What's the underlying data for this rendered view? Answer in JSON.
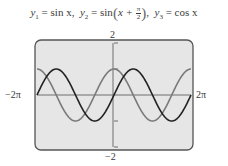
{
  "title": {
    "y1_label": "y",
    "y1_sub": "1",
    "y1_expr": "sin x,",
    "y2_label": "y",
    "y2_sub": "2",
    "y2_expr_prefix": "sin",
    "y2_expr_inner": "x +",
    "y2_frac_num": "π",
    "y2_frac_den": "2",
    "y2_suffix": ",",
    "y3_label": "y",
    "y3_sub": "3",
    "y3_expr": "cos x",
    "equals": "="
  },
  "axes": {
    "xmin_label": "−2π",
    "xmax_label": "2π",
    "ymax_label": "2",
    "ymin_label": "−2"
  },
  "colors": {
    "screen_bg": "#e6e6e6",
    "frame": "#555555",
    "axis": "#6e6e6e",
    "sin_curve": "#222222",
    "cos_curve": "#7a7a7a"
  },
  "chart_data": {
    "type": "line",
    "xlabel": "",
    "ylabel": "",
    "xlim": [
      -6.2832,
      6.2832
    ],
    "ylim": [
      -2,
      2
    ],
    "x_tick_labels": [
      "−2π",
      "2π"
    ],
    "y_tick_labels": [
      "2",
      "−2"
    ],
    "y_ticks": [
      -1,
      1
    ],
    "grid": false,
    "legend": "none",
    "series": [
      {
        "name": "y1 = sin x",
        "function": "sin(x)",
        "color": "#222222",
        "x": [
          -6.2832,
          -4.7124,
          -3.1416,
          -1.5708,
          0,
          1.5708,
          3.1416,
          4.7124,
          6.2832
        ],
        "values": [
          0,
          1,
          0,
          -1,
          0,
          1,
          0,
          -1,
          0
        ]
      },
      {
        "name": "y2 = sin(x + π/2)",
        "function": "sin(x + pi/2)",
        "color": "#7a7a7a",
        "x": [
          -6.2832,
          -4.7124,
          -3.1416,
          -1.5708,
          0,
          1.5708,
          3.1416,
          4.7124,
          6.2832
        ],
        "values": [
          1,
          0,
          -1,
          0,
          1,
          0,
          -1,
          0,
          1
        ]
      },
      {
        "name": "y3 = cos x",
        "function": "cos(x)",
        "color": "#7a7a7a",
        "x": [
          -6.2832,
          -4.7124,
          -3.1416,
          -1.5708,
          0,
          1.5708,
          3.1416,
          4.7124,
          6.2832
        ],
        "values": [
          1,
          0,
          -1,
          0,
          1,
          0,
          -1,
          0,
          1
        ]
      }
    ],
    "annotation": "y2 and y3 graphs coincide"
  }
}
